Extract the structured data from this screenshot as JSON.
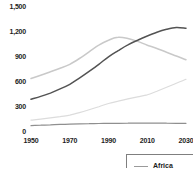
{
  "colors": {
    "background": "#ffffff",
    "text": "#1c1c1c",
    "legend_border": "#7f7f7f"
  },
  "legend": {
    "entries": [
      {
        "label": "Africa",
        "swatch_color": "#9a9a9a"
      }
    ]
  },
  "chart_data": {
    "type": "line",
    "title": "",
    "xlabel": "",
    "ylabel": "",
    "xlim": [
      1950,
      2030
    ],
    "ylim": [
      0,
      1500
    ],
    "grid": false,
    "legend_position": "bottom-right (clipped at image edge, only 'Africa' visible)",
    "x_ticks": [
      {
        "label": "1950",
        "value": 1950
      },
      {
        "label": "1970",
        "value": 1970
      },
      {
        "label": "1990",
        "value": 1990
      },
      {
        "label": "2010",
        "value": 2010
      },
      {
        "label": "2030",
        "value": 2030
      }
    ],
    "y_ticks": [
      {
        "label": "0",
        "value": 0
      },
      {
        "label": "300",
        "value": 300
      },
      {
        "label": "600",
        "value": 600
      },
      {
        "label": "900",
        "value": 900
      },
      {
        "label": "1,200",
        "value": 1200
      },
      {
        "label": "1,500",
        "value": 1500
      }
    ],
    "x": [
      1950,
      1955,
      1960,
      1965,
      1970,
      1975,
      1980,
      1985,
      1990,
      1995,
      2000,
      2005,
      2010,
      2015,
      2020,
      2025,
      2030
    ],
    "series": [
      {
        "name": "line-3-pale-rising",
        "color": "#dcdcdc",
        "stroke_width": 1.2,
        "values": [
          130,
          143,
          158,
          173,
          190,
          220,
          255,
          292,
          330,
          358,
          385,
          410,
          435,
          478,
          525,
          572,
          620
        ]
      },
      {
        "name": "line-2-light-hump",
        "color": "#c9c9c9",
        "stroke_width": 1.5,
        "values": [
          630,
          668,
          710,
          752,
          800,
          870,
          950,
          1030,
          1090,
          1125,
          1110,
          1075,
          1030,
          990,
          945,
          900,
          855
        ]
      },
      {
        "name": "line-4-flat-low",
        "color": "#8f8f8f",
        "stroke_width": 1.2,
        "values": [
          65,
          70,
          75,
          79,
          82,
          85,
          88,
          90,
          92,
          93,
          94,
          95,
          95,
          95,
          94,
          93,
          92
        ]
      },
      {
        "name": "line-1-dark-s-curve",
        "color": "#535353",
        "stroke_width": 1.5,
        "values": [
          380,
          415,
          455,
          505,
          560,
          635,
          715,
          800,
          890,
          965,
          1035,
          1090,
          1140,
          1185,
          1220,
          1242,
          1232
        ]
      }
    ]
  }
}
